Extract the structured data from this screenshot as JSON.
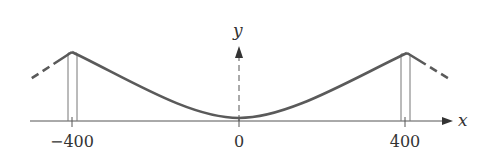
{
  "diagram": {
    "type": "suspension-bridge-cable",
    "axes": {
      "x_label": "x",
      "y_label": "y"
    },
    "ticks": [
      {
        "label": "−400",
        "value": -400
      },
      {
        "label": "0",
        "value": 0
      },
      {
        "label": "400",
        "value": 400
      }
    ],
    "colors": {
      "cable": "#5a5a5a",
      "axis": "#555555",
      "tower": "#777777",
      "text": "#333333"
    }
  }
}
